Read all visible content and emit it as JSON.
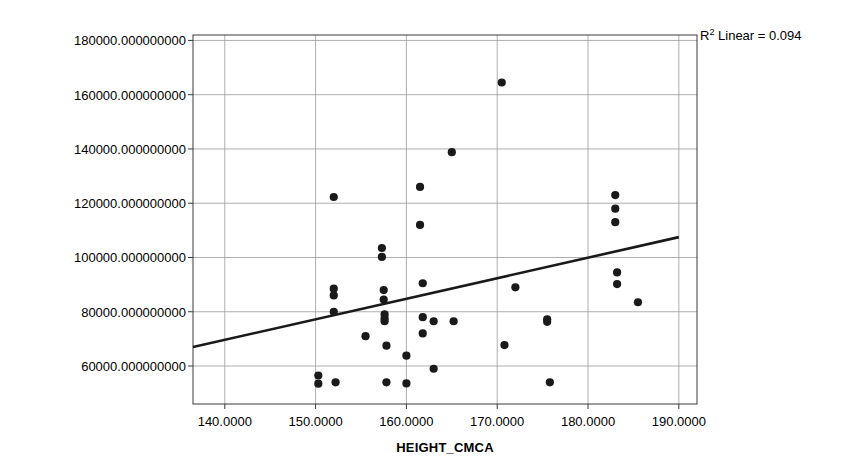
{
  "chart_data": {
    "type": "scatter",
    "title": "",
    "xlabel": "HEIGHT_CMCA",
    "ylabel": "WEIGHT_WTGCAL",
    "xlim": [
      136.5,
      192.0
    ],
    "ylim": [
      46000,
      182000
    ],
    "x_ticks": [
      140,
      150,
      160,
      170,
      180,
      190
    ],
    "x_tick_labels": [
      "140.0000",
      "150.0000",
      "160.0000",
      "170.0000",
      "180.0000",
      "190.0000"
    ],
    "y_ticks": [
      60000,
      80000,
      100000,
      120000,
      140000,
      160000,
      180000
    ],
    "y_tick_labels": [
      "60000.000000000",
      "80000.000000000",
      "100000.000000000",
      "120000.000000000",
      "140000.000000000",
      "160000.000000000",
      "180000.000000000"
    ],
    "grid": true,
    "legend": "none",
    "annotations": [
      {
        "text": "R² Linear = 0.094",
        "r2_value": 0.094,
        "position": "top-right"
      }
    ],
    "marker": {
      "shape": "circle",
      "color": "#1a1a1a",
      "size": 5
    },
    "fit_line": {
      "type": "linear",
      "color": "#1a1a1a",
      "x_start": 136.5,
      "y_start": 67000,
      "x_end": 190.0,
      "y_end": 107500
    },
    "points": [
      {
        "x": 150.3,
        "y": 56500
      },
      {
        "x": 150.3,
        "y": 53500
      },
      {
        "x": 152.0,
        "y": 122300
      },
      {
        "x": 152.0,
        "y": 88500
      },
      {
        "x": 152.0,
        "y": 86000
      },
      {
        "x": 152.0,
        "y": 80000
      },
      {
        "x": 152.2,
        "y": 54000
      },
      {
        "x": 155.5,
        "y": 71000
      },
      {
        "x": 157.3,
        "y": 103500
      },
      {
        "x": 157.3,
        "y": 100200
      },
      {
        "x": 157.5,
        "y": 88000
      },
      {
        "x": 157.5,
        "y": 84500
      },
      {
        "x": 157.6,
        "y": 79000
      },
      {
        "x": 157.6,
        "y": 77500
      },
      {
        "x": 157.6,
        "y": 76500
      },
      {
        "x": 157.8,
        "y": 67500
      },
      {
        "x": 157.8,
        "y": 54000
      },
      {
        "x": 160.0,
        "y": 63800
      },
      {
        "x": 160.0,
        "y": 53600
      },
      {
        "x": 161.5,
        "y": 126000
      },
      {
        "x": 161.5,
        "y": 112000
      },
      {
        "x": 161.8,
        "y": 90500
      },
      {
        "x": 161.8,
        "y": 78000
      },
      {
        "x": 161.8,
        "y": 72000
      },
      {
        "x": 163.0,
        "y": 76500
      },
      {
        "x": 163.0,
        "y": 59000
      },
      {
        "x": 165.0,
        "y": 138800
      },
      {
        "x": 165.2,
        "y": 76500
      },
      {
        "x": 170.5,
        "y": 164500
      },
      {
        "x": 170.8,
        "y": 67700
      },
      {
        "x": 172.0,
        "y": 89000
      },
      {
        "x": 175.5,
        "y": 77200
      },
      {
        "x": 175.5,
        "y": 76300
      },
      {
        "x": 175.8,
        "y": 54000
      },
      {
        "x": 183.0,
        "y": 123000
      },
      {
        "x": 183.0,
        "y": 118000
      },
      {
        "x": 183.0,
        "y": 113000
      },
      {
        "x": 183.2,
        "y": 94500
      },
      {
        "x": 183.2,
        "y": 90200
      },
      {
        "x": 185.5,
        "y": 83500
      }
    ]
  }
}
